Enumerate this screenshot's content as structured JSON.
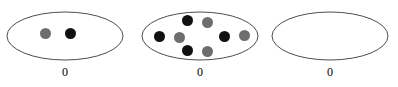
{
  "figure": {
    "type": "set-diagram",
    "background_color": "#ffffff",
    "ellipse_stroke_color": "#4d4d4d",
    "ellipse_fill_color": "#ffffff",
    "ellipse_stroke_width": 1,
    "colors": {
      "black_dot": "#111111",
      "gray_dot": "#6e6e6e"
    },
    "dot_diameter": 11,
    "groups": [
      {
        "name": "group-1",
        "label": "0",
        "left": 7,
        "top": 12,
        "width": 116,
        "height": 48,
        "label_top": 66,
        "dot_count": 2,
        "black_count": 1,
        "gray_count": 1,
        "dots": [
          {
            "name": "dot-gray-1",
            "color": "gray",
            "cx": 45,
            "cy": 33
          },
          {
            "name": "dot-black-1",
            "color": "black",
            "cx": 70,
            "cy": 33
          }
        ]
      },
      {
        "name": "group-2",
        "label": "0",
        "left": 142,
        "top": 12,
        "width": 116,
        "height": 48,
        "label_top": 66,
        "dot_count": 8,
        "black_count": 4,
        "gray_count": 4,
        "dots": [
          {
            "name": "dot-black-top",
            "color": "black",
            "cx": 187,
            "cy": 20
          },
          {
            "name": "dot-gray-top",
            "color": "gray",
            "cx": 207,
            "cy": 22
          },
          {
            "name": "dot-black-left",
            "color": "black",
            "cx": 159,
            "cy": 36
          },
          {
            "name": "dot-gray-left",
            "color": "gray",
            "cx": 179,
            "cy": 37
          },
          {
            "name": "dot-black-right",
            "color": "black",
            "cx": 224,
            "cy": 36
          },
          {
            "name": "dot-gray-right",
            "color": "gray",
            "cx": 244,
            "cy": 35
          },
          {
            "name": "dot-black-bottom",
            "color": "black",
            "cx": 187,
            "cy": 50
          },
          {
            "name": "dot-gray-bottom",
            "color": "gray",
            "cx": 207,
            "cy": 51
          }
        ]
      },
      {
        "name": "group-3",
        "label": "0",
        "left": 272,
        "top": 12,
        "width": 116,
        "height": 48,
        "label_top": 66,
        "dot_count": 0,
        "black_count": 0,
        "gray_count": 0,
        "dots": []
      }
    ]
  }
}
